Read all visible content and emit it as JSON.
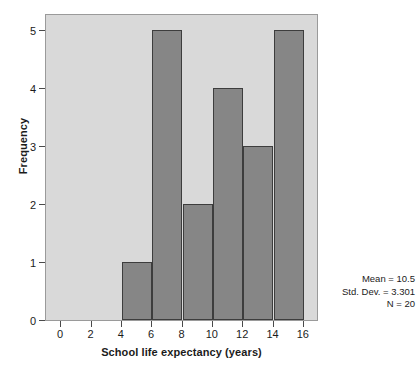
{
  "chart_data": {
    "type": "bar",
    "subtype": "histogram",
    "title": "",
    "xlabel": "School life expectancy (years)",
    "ylabel": "Frequency",
    "xlim": [
      -1,
      17
    ],
    "ylim": [
      0,
      5.3
    ],
    "xticks": [
      0,
      2,
      4,
      6,
      8,
      10,
      12,
      14,
      16
    ],
    "xtick_labels": [
      "0",
      "2",
      "4",
      "6",
      "8",
      "10",
      "12",
      "14",
      "16"
    ],
    "yticks": [
      0,
      1,
      2,
      3,
      4,
      5
    ],
    "ytick_labels": [
      "0",
      "1",
      "2",
      "3",
      "4",
      "5"
    ],
    "grid": false,
    "legend": false,
    "bin_width": 2,
    "bins": [
      {
        "start": 4,
        "end": 6,
        "label": "4–6",
        "value": 1
      },
      {
        "start": 6,
        "end": 8,
        "label": "6–8",
        "value": 5
      },
      {
        "start": 8,
        "end": 10,
        "label": "8–10",
        "value": 2
      },
      {
        "start": 10,
        "end": 12,
        "label": "10–12",
        "value": 4
      },
      {
        "start": 12,
        "end": 14,
        "label": "12–14",
        "value": 3
      },
      {
        "start": 14,
        "end": 16,
        "label": "14–16",
        "value": 5
      }
    ],
    "categories": [
      "4–6",
      "6–8",
      "8–10",
      "10–12",
      "12–14",
      "14–16"
    ],
    "values": [
      1,
      5,
      2,
      4,
      3,
      5
    ],
    "annotations": {
      "mean": "Mean = 10.5",
      "std_dev": "Std. Dev. = 3.301",
      "n": "N = 20"
    },
    "colors": {
      "bar_fill": "#868686",
      "bar_edge": "#3d3d3d",
      "plot_background": "#d9d9d9",
      "canvas_background": "#ffffff",
      "text": "#1b1b1b",
      "axis": "#4a4a4a"
    }
  }
}
